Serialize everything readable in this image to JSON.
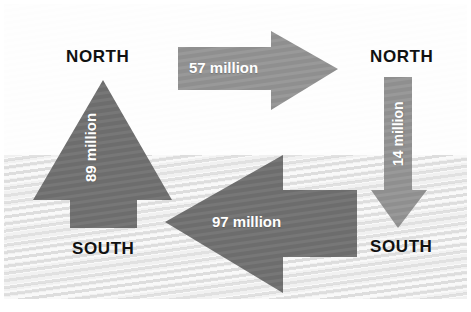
{
  "diagram": {
    "type": "flow-diagram",
    "background": {
      "upper_band_color": "#fdfdfd",
      "lower_band_color": "#f1f1f1",
      "divider_y": 155
    },
    "colors": {
      "arrow_dark": "#6d6d6d",
      "arrow_light": "#8f8f8f",
      "label_text": "#111111",
      "value_text": "#ffffff"
    },
    "regions": [
      {
        "id": "north-left",
        "label": "NORTH",
        "column": "left"
      },
      {
        "id": "south-left",
        "label": "SOUTH",
        "column": "left"
      },
      {
        "id": "north-right",
        "label": "NORTH",
        "column": "right"
      },
      {
        "id": "south-right",
        "label": "SOUTH",
        "column": "right"
      }
    ],
    "flows": [
      {
        "id": "north-to-north",
        "value": "57 million",
        "amount": 57,
        "unit": "million",
        "direction": "right",
        "from": "NORTH",
        "to": "NORTH",
        "color": "#8f8f8f"
      },
      {
        "id": "south-to-north-left",
        "value": "89 million",
        "amount": 89,
        "unit": "million",
        "direction": "up",
        "from": "SOUTH",
        "to": "NORTH",
        "color": "#6d6d6d"
      },
      {
        "id": "south-to-south",
        "value": "97 million",
        "amount": 97,
        "unit": "million",
        "direction": "left",
        "from": "SOUTH",
        "to": "SOUTH",
        "color": "#6d6d6d"
      },
      {
        "id": "north-to-south-right",
        "value": "14 million",
        "amount": 14,
        "unit": "million",
        "direction": "down",
        "from": "NORTH",
        "to": "SOUTH",
        "color": "#8f8f8f"
      }
    ]
  }
}
